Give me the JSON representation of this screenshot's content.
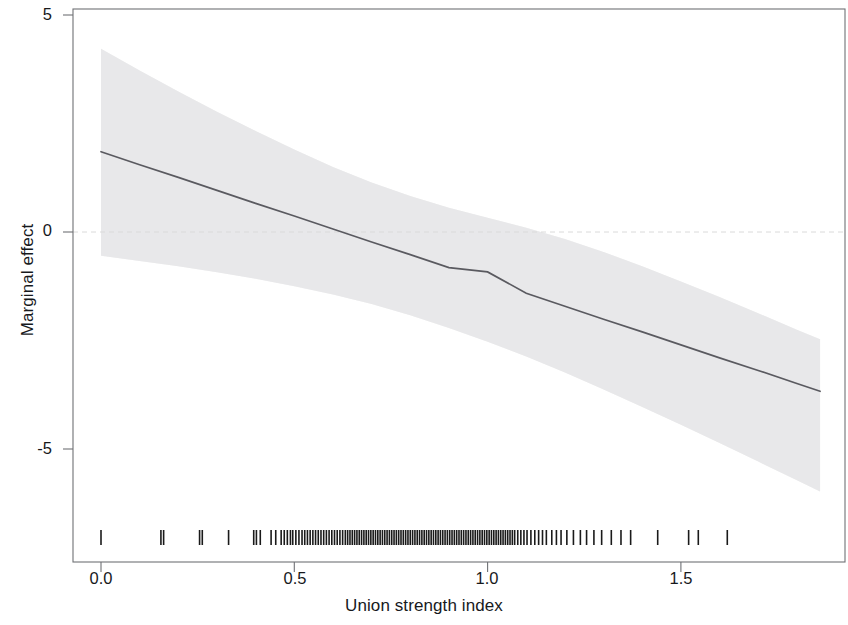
{
  "figure": {
    "width": 848,
    "height": 625,
    "background_color": "#ffffff"
  },
  "chart_data": {
    "type": "line",
    "title": "",
    "subtitle": "",
    "xlabel": "Union strength index",
    "ylabel": "Marginal effect",
    "xlim": [
      -0.07,
      1.94
    ],
    "ylim": [
      -7.8,
      5.7
    ],
    "xticks": [
      0.0,
      0.5,
      1.0,
      1.5
    ],
    "xticklabels": [
      "0.0",
      "0.5",
      "1.0",
      "1.5"
    ],
    "yticks": [
      5,
      0,
      -5
    ],
    "yticklabels": [
      "5",
      "0",
      "-5"
    ],
    "grid": false,
    "legend": "none",
    "annotations": [],
    "zero_reference_line": {
      "y": 0,
      "style": "dashed",
      "color": "#d8d8d8"
    },
    "series": [
      {
        "name": "Marginal effect",
        "type": "line",
        "color": "#5a5a60",
        "linewidth": 1.6,
        "x": [
          0.0,
          0.1,
          0.2,
          0.3,
          0.4,
          0.5,
          0.6,
          0.7,
          0.8,
          0.9,
          1.0,
          1.1,
          1.2,
          1.3,
          1.4,
          1.5,
          1.6,
          1.7,
          1.8,
          1.86
        ],
        "y": [
          1.85,
          1.55,
          1.26,
          0.96,
          0.66,
          0.37,
          0.07,
          -0.23,
          -0.52,
          -0.82,
          -0.92,
          -1.41,
          -1.71,
          -2.01,
          -2.3,
          -2.6,
          -2.9,
          -3.19,
          -3.49,
          -3.67
        ]
      },
      {
        "name": "95% confidence interval",
        "type": "band",
        "fill_color": "#ededee",
        "x": [
          0.0,
          0.1,
          0.2,
          0.3,
          0.4,
          0.5,
          0.6,
          0.7,
          0.8,
          0.9,
          1.0,
          1.1,
          1.2,
          1.3,
          1.4,
          1.5,
          1.6,
          1.7,
          1.8,
          1.86
        ],
        "upper": [
          4.22,
          3.72,
          3.24,
          2.77,
          2.33,
          1.9,
          1.5,
          1.14,
          0.83,
          0.56,
          0.33,
          0.1,
          -0.16,
          -0.46,
          -0.79,
          -1.14,
          -1.5,
          -1.87,
          -2.25,
          -2.47
        ],
        "lower": [
          -0.55,
          -0.67,
          -0.79,
          -0.93,
          -1.08,
          -1.25,
          -1.44,
          -1.66,
          -1.92,
          -2.21,
          -2.53,
          -2.87,
          -3.24,
          -3.63,
          -4.03,
          -4.44,
          -4.86,
          -5.29,
          -5.72,
          -5.98
        ]
      },
      {
        "name": "Data rug",
        "type": "rug",
        "color": "#1a1a1a",
        "y_position": -7.0,
        "x": [
          0.0,
          0.155,
          0.162,
          0.255,
          0.262,
          0.33,
          0.395,
          0.402,
          0.412,
          0.44,
          0.452,
          0.466,
          0.474,
          0.482,
          0.49,
          0.496,
          0.504,
          0.512,
          0.52,
          0.527,
          0.534,
          0.541,
          0.548,
          0.555,
          0.562,
          0.569,
          0.576,
          0.583,
          0.59,
          0.597,
          0.604,
          0.611,
          0.618,
          0.625,
          0.632,
          0.638,
          0.644,
          0.65,
          0.656,
          0.662,
          0.668,
          0.674,
          0.68,
          0.686,
          0.692,
          0.698,
          0.704,
          0.71,
          0.716,
          0.722,
          0.728,
          0.734,
          0.74,
          0.746,
          0.752,
          0.758,
          0.764,
          0.77,
          0.776,
          0.782,
          0.788,
          0.794,
          0.8,
          0.806,
          0.812,
          0.818,
          0.824,
          0.83,
          0.836,
          0.842,
          0.848,
          0.854,
          0.86,
          0.866,
          0.872,
          0.878,
          0.884,
          0.89,
          0.896,
          0.902,
          0.908,
          0.914,
          0.92,
          0.926,
          0.932,
          0.938,
          0.944,
          0.95,
          0.956,
          0.962,
          0.968,
          0.974,
          0.98,
          0.986,
          0.992,
          0.998,
          1.004,
          1.01,
          1.016,
          1.022,
          1.028,
          1.034,
          1.04,
          1.046,
          1.052,
          1.058,
          1.064,
          1.07,
          1.078,
          1.086,
          1.094,
          1.102,
          1.112,
          1.122,
          1.132,
          1.142,
          1.152,
          1.166,
          1.178,
          1.19,
          1.205,
          1.222,
          1.24,
          1.256,
          1.275,
          1.295,
          1.32,
          1.345,
          1.37,
          1.44,
          1.52,
          1.545,
          1.62
        ]
      }
    ]
  },
  "axes": {
    "frame": {
      "left": 73,
      "right": 845,
      "top": 9,
      "bottom": 562,
      "color": "#6f7175"
    },
    "x_tick_labels": [
      "0.0",
      "0.5",
      "1.0",
      "1.5"
    ],
    "y_tick_labels": [
      "5",
      "0",
      "-5"
    ],
    "x_axis_title": "Union strength index",
    "y_axis_title": "Marginal effect"
  },
  "colors": {
    "line": "#5a5a60",
    "band": "#ededee",
    "rug": "#1a1a1a",
    "frame": "#6f7175",
    "text": "#17191c",
    "zero_line": "#d8d8d8"
  }
}
